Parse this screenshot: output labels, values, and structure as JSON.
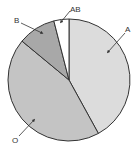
{
  "chart_data": {
    "type": "pie",
    "title": "",
    "categories": [
      "A",
      "O",
      "B",
      "AB"
    ],
    "values": [
      42,
      44,
      10,
      4
    ],
    "colors": [
      "#dcdcdc",
      "#c4c4c4",
      "#a8a8a8",
      "#ffffff"
    ],
    "legend": "none (callout labels with arrows)",
    "start_angle": "12 o'clock, clockwise"
  },
  "labels": {
    "a": "A",
    "o": "O",
    "b": "B",
    "ab": "AB"
  }
}
